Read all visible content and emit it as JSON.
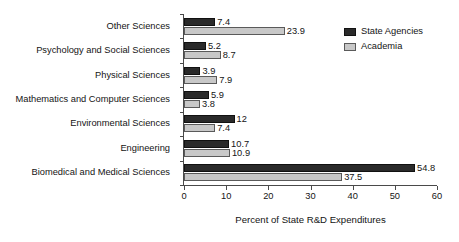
{
  "chart_data": {
    "type": "bar",
    "orientation": "horizontal",
    "title": "",
    "xlabel": "Percent of State R&D Expenditures",
    "ylabel": "",
    "xlim": [
      0,
      60
    ],
    "xticks": [
      0,
      10,
      20,
      30,
      40,
      50,
      60
    ],
    "xticklabels": [
      "0",
      "10",
      "20",
      "30",
      "40",
      "50",
      "60"
    ],
    "grid": false,
    "legend_position": "top-right",
    "categories": [
      "Other Sciences",
      "Psychology and Social Sciences",
      "Physical Sciences",
      "Mathematics and Computer Sciences",
      "Environmental Sciences",
      "Engineering",
      "Biomedical and Medical Sciences"
    ],
    "series": [
      {
        "name": "State Agencies",
        "color": "#2a2a2a",
        "values": [
          7.4,
          5.2,
          3.9,
          5.9,
          12,
          10.7,
          54.8
        ],
        "labels": [
          "7.4",
          "5.2",
          "3.9",
          "5.9",
          "12",
          "10.7",
          "54.8"
        ]
      },
      {
        "name": "Academia",
        "color": "#c8c8c8",
        "values": [
          23.9,
          8.7,
          7.9,
          3.8,
          7.4,
          10.9,
          37.5
        ],
        "labels": [
          "23.9",
          "8.7",
          "7.9",
          "3.8",
          "7.4",
          "10.9",
          "37.5"
        ]
      }
    ]
  }
}
